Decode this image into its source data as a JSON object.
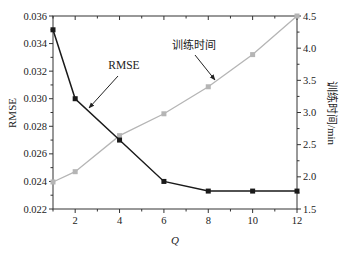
{
  "chart_data": {
    "type": "line",
    "title": "",
    "xlabel": "Q",
    "ylabel": "RMSE",
    "y2label": "训练时间/min",
    "x": [
      1,
      2,
      4,
      6,
      8,
      10,
      12
    ],
    "xticks": [
      2,
      4,
      6,
      8,
      10,
      12
    ],
    "xlim": [
      1,
      12
    ],
    "ylim": [
      0.022,
      0.036
    ],
    "yticks": [
      "0.022",
      "0.024",
      "0.026",
      "0.028",
      "0.030",
      "0.032",
      "0.034",
      "0.036"
    ],
    "y2lim": [
      1.5,
      4.5
    ],
    "y2ticks": [
      "1.5",
      "2.0",
      "2.5",
      "3.0",
      "3.5",
      "4.0",
      "4.5"
    ],
    "grid": false,
    "legend": "none (annotated with arrows)",
    "series": [
      {
        "name": "RMSE",
        "axis": "left",
        "color": "#1a1a1a",
        "marker": "square",
        "values": [
          0.035,
          0.03,
          0.027,
          0.024,
          0.0233,
          0.0233,
          0.0233
        ]
      },
      {
        "name": "训练时间",
        "axis": "right",
        "color": "#b5b5b5",
        "marker": "square",
        "values": [
          1.92,
          2.08,
          2.64,
          2.98,
          3.4,
          3.9,
          4.5
        ]
      }
    ],
    "annotations": [
      {
        "text": "RMSE",
        "target_series": "RMSE"
      },
      {
        "text": "训练时间",
        "target_series": "训练时间"
      }
    ]
  }
}
